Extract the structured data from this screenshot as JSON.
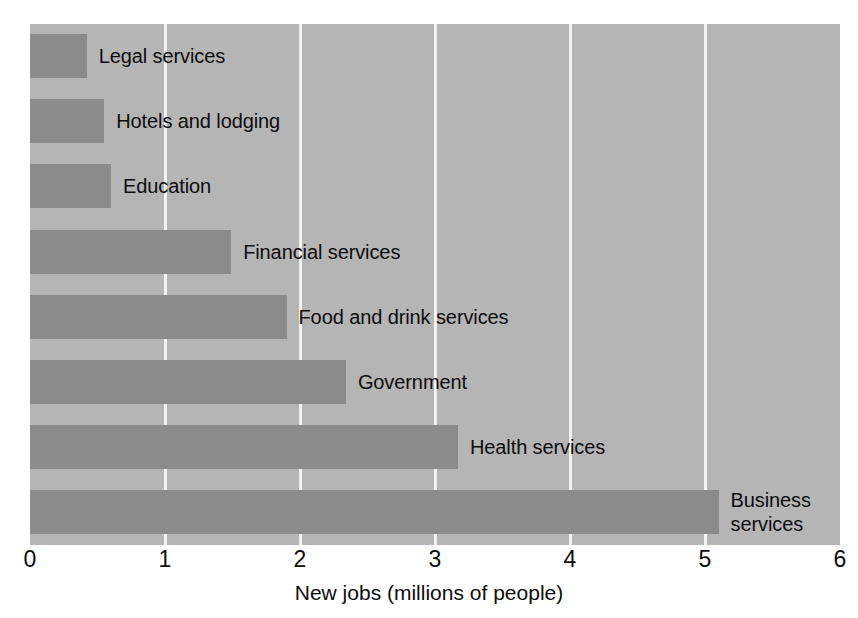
{
  "chart_data": {
    "type": "bar",
    "orientation": "horizontal",
    "title": "",
    "subtitle": "",
    "xlabel": "New jobs (millions of people)",
    "ylabel": "",
    "xlim": [
      0,
      6
    ],
    "xticks": [
      "0",
      "1",
      "2",
      "3",
      "4",
      "5",
      "6"
    ],
    "grid": "vertical",
    "legend": "none",
    "categories": [
      "Legal services",
      "Hotels and lodging",
      "Education",
      "Financial services",
      "Food and drink services",
      "Government",
      "Health services",
      "Business services"
    ],
    "values": [
      0.42,
      0.55,
      0.6,
      1.49,
      1.9,
      2.34,
      3.17,
      5.1
    ],
    "bar_color": "#8b8b8b",
    "plot_background": "#b5b5b5",
    "gridline_color": "#f2f2f2",
    "text_color": "#0d0d0d",
    "label_wraps": {
      "Business services": "Business\nservices"
    }
  },
  "axis": {
    "title": "New jobs (millions of people)",
    "ticks": [
      {
        "label": "0",
        "value": 0
      },
      {
        "label": "1",
        "value": 1
      },
      {
        "label": "2",
        "value": 2
      },
      {
        "label": "3",
        "value": 3
      },
      {
        "label": "4",
        "value": 4
      },
      {
        "label": "5",
        "value": 5
      },
      {
        "label": "6",
        "value": 6
      }
    ]
  },
  "bars": [
    {
      "label": "Legal services",
      "value": 0.42
    },
    {
      "label": "Hotels and lodging",
      "value": 0.55
    },
    {
      "label": "Education",
      "value": 0.6
    },
    {
      "label": "Financial services",
      "value": 1.49
    },
    {
      "label": "Food and drink services",
      "value": 1.9
    },
    {
      "label": "Government",
      "value": 2.34
    },
    {
      "label": "Health services",
      "value": 3.17
    },
    {
      "label": "Business services",
      "value": 5.1
    }
  ]
}
